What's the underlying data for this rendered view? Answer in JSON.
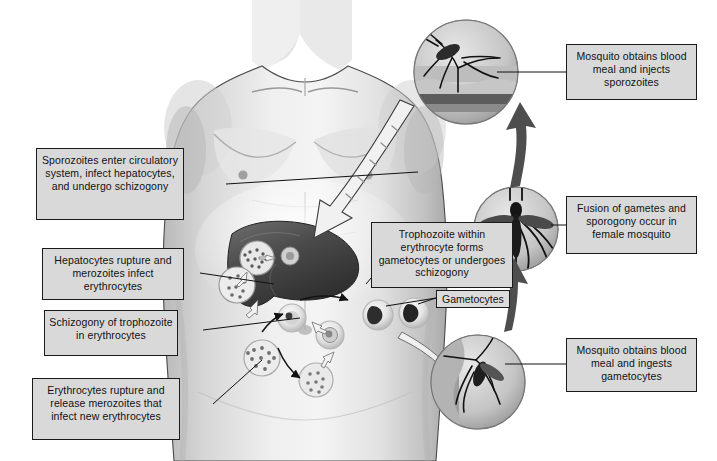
{
  "figure": {
    "background_color": "#ffffff",
    "box_fill": "#d9d9d9",
    "box_border": "#1b1b1b",
    "style": "grayscale medical illustration"
  },
  "callouts": {
    "mosquito_injects": "Mosquito obtains blood meal and injects sporozoites",
    "sporozoites_enter": "Sporozoites enter circulatory system, infect hepatocytes, and undergo schizogony",
    "hepatocytes_rupture": "Hepatocytes rupture and merozoites infect erythrocytes",
    "schizogony_troph": "Schizogony of trophozoite in erythrocytes",
    "erythrocytes_rupture": "Erythrocytes rupture and release merozoites that infect new erythrocytes",
    "trophozoite_within": "Trophozoite within erythrocyte forms gametocytes or undergoes schizogony",
    "fusion_gametes": "Fusion of gametes and sporogony occur in female mosquito",
    "mosquito_ingests": "Mosquito obtains blood meal and ingests gametocytes",
    "gametocytes_tag": "Gametocytes"
  },
  "illustration_parts": {
    "human": "grayscale male torso, head to hips, front view",
    "liver": "dark gray liver with hepatocyte schizonts",
    "inset_top": "circular inset of mosquito biting skin, injecting sporozoites",
    "inset_mid": "circular inset of female Anopheles mosquito, dorsal view",
    "inset_bottom": "circular inset of mosquito feeding and ingesting gametocytes",
    "erythrocyte_cycle": "ring stage, trophozoite, schizont with merozoites, gametocytes"
  }
}
